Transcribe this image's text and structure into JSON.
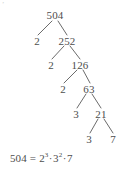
{
  "figure": {
    "type": "factor-tree",
    "subject_number": "504",
    "corner_mark": "’"
  },
  "tree": {
    "nodes": [
      {
        "id": "n504",
        "label": "504",
        "x": 55,
        "y": 15,
        "role": "root"
      },
      {
        "id": "n2a",
        "label": "2",
        "x": 37,
        "y": 41,
        "role": "prime-factor"
      },
      {
        "id": "n252",
        "label": "252",
        "x": 67,
        "y": 41,
        "role": "composite"
      },
      {
        "id": "n2b",
        "label": "2",
        "x": 51,
        "y": 65,
        "role": "prime-factor"
      },
      {
        "id": "n126",
        "label": "126",
        "x": 80,
        "y": 65,
        "role": "composite"
      },
      {
        "id": "n2c",
        "label": "2",
        "x": 63,
        "y": 89,
        "role": "prime-factor"
      },
      {
        "id": "n63",
        "label": "63",
        "x": 89,
        "y": 89,
        "role": "composite"
      },
      {
        "id": "n3a",
        "label": "3",
        "x": 76,
        "y": 114,
        "role": "prime-factor"
      },
      {
        "id": "n21",
        "label": "21",
        "x": 101,
        "y": 114,
        "role": "composite"
      },
      {
        "id": "n3b",
        "label": "3",
        "x": 89,
        "y": 139,
        "role": "prime-factor"
      },
      {
        "id": "n7",
        "label": "7",
        "x": 113,
        "y": 139,
        "role": "prime-factor"
      }
    ],
    "branches": [
      {
        "from": "n504",
        "to": "n2a",
        "x1": 52,
        "y1": 21,
        "x2": 38,
        "y2": 35
      },
      {
        "from": "n504",
        "to": "n252",
        "x1": 58,
        "y1": 21,
        "x2": 67,
        "y2": 35
      },
      {
        "from": "n252",
        "to": "n2b",
        "x1": 64,
        "y1": 46,
        "x2": 52,
        "y2": 59
      },
      {
        "from": "n252",
        "to": "n126",
        "x1": 70,
        "y1": 46,
        "x2": 80,
        "y2": 59
      },
      {
        "from": "n126",
        "to": "n2c",
        "x1": 77,
        "y1": 70,
        "x2": 64,
        "y2": 83
      },
      {
        "from": "n126",
        "to": "n63",
        "x1": 83,
        "y1": 70,
        "x2": 90,
        "y2": 83
      },
      {
        "from": "n63",
        "to": "n3a",
        "x1": 86,
        "y1": 94,
        "x2": 77,
        "y2": 108
      },
      {
        "from": "n63",
        "to": "n21",
        "x1": 92,
        "y1": 94,
        "x2": 101,
        "y2": 108
      },
      {
        "from": "n21",
        "to": "n3b",
        "x1": 98,
        "y1": 119,
        "x2": 90,
        "y2": 133
      },
      {
        "from": "n21",
        "to": "n7",
        "x1": 104,
        "y1": 119,
        "x2": 113,
        "y2": 133
      }
    ],
    "line_color": "#5a5a5a"
  },
  "equation": {
    "left": "504",
    "equals": "=",
    "terms": [
      {
        "base": "2",
        "exponent": "3"
      },
      {
        "base": "3",
        "exponent": "2"
      },
      {
        "base": "7",
        "exponent": ""
      }
    ],
    "separator": "·",
    "full_text": "504 = 2³·3²·7"
  }
}
